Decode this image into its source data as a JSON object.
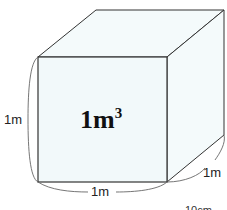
{
  "diagram": {
    "volume_label": "1m",
    "volume_exponent": "3",
    "height_label": "1m",
    "width_label": "1m",
    "depth_label": "1m",
    "partial_label": "10cm",
    "colors": {
      "face_fill": "#f3fafb",
      "edge": "#333333",
      "brace": "#666666"
    }
  }
}
